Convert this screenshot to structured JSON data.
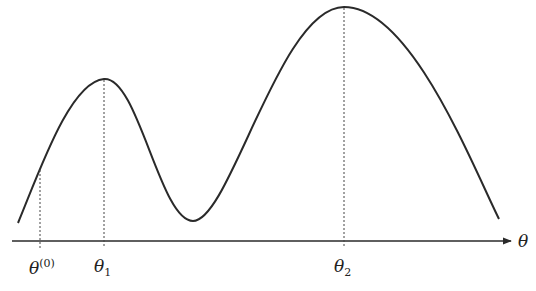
{
  "figure": {
    "axis_label": "θ",
    "ticks": [
      {
        "id": "theta0",
        "base": "θ",
        "sup": "(0)",
        "sub": "",
        "x": 40,
        "curve_y": 170
      },
      {
        "id": "theta1",
        "base": "θ",
        "sup": "",
        "sub": "1",
        "x": 104,
        "curve_y": 79
      },
      {
        "id": "theta2",
        "base": "θ",
        "sup": "",
        "sub": "2",
        "x": 344,
        "curve_y": 7
      }
    ],
    "caption": "",
    "colors": {
      "curve": "#2a2a2a",
      "axis": "#2a2a2a",
      "dashed": "#444444"
    }
  }
}
